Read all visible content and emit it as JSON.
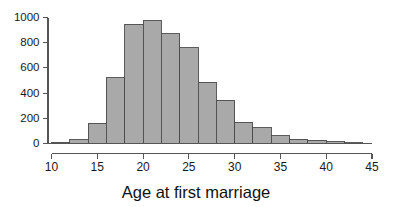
{
  "chart_data": {
    "type": "bar",
    "title": "",
    "xlabel": "Age at first marriage",
    "ylabel": "",
    "xlim": [
      10,
      45
    ],
    "ylim": [
      0,
      1000
    ],
    "grid": false,
    "legend": null,
    "bin_width": 2,
    "bin_edges": [
      10,
      12,
      14,
      16,
      18,
      20,
      22,
      24,
      26,
      28,
      30,
      32,
      34,
      36,
      38,
      40,
      42,
      44
    ],
    "categories": [
      "10-12",
      "12-14",
      "14-16",
      "16-18",
      "18-20",
      "20-22",
      "22-24",
      "24-26",
      "26-28",
      "28-30",
      "30-32",
      "32-34",
      "34-36",
      "36-38",
      "38-40",
      "40-42",
      "42-44"
    ],
    "values": [
      10,
      30,
      160,
      520,
      945,
      975,
      870,
      760,
      485,
      345,
      170,
      125,
      60,
      35,
      25,
      15,
      3
    ],
    "xticks": [
      10,
      15,
      20,
      25,
      30,
      35,
      40,
      45
    ],
    "xtick_labels": [
      "10",
      "15",
      "20",
      "25",
      "30",
      "35",
      "40",
      "45"
    ],
    "yticks": [
      0,
      200,
      400,
      600,
      800,
      1000
    ],
    "ytick_labels": [
      "0",
      "200",
      "400",
      "600",
      "800",
      "1000"
    ],
    "bar_fill_color": "#a9a9a9",
    "bar_stroke_color": "#4a4a4a",
    "axis_color": "#555555",
    "text_color": "#1a1a1a"
  }
}
